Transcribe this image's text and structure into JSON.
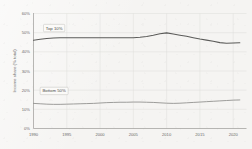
{
  "chart_data": {
    "type": "line",
    "title": "",
    "xlabel": "",
    "ylabel": "Income share (% total)",
    "xlim": [
      1990,
      2022
    ],
    "ylim": [
      0,
      60
    ],
    "grid": true,
    "legend_position": "inline-annotations",
    "x": [
      1990,
      1991,
      1992,
      1993,
      1994,
      1995,
      1996,
      1997,
      1998,
      1999,
      2000,
      2001,
      2002,
      2003,
      2004,
      2005,
      2006,
      2007,
      2008,
      2009,
      2010,
      2011,
      2012,
      2013,
      2014,
      2015,
      2016,
      2017,
      2018,
      2019,
      2020,
      2021
    ],
    "xticks": [
      "1990",
      "1995",
      "2000",
      "2005",
      "2010",
      "2015",
      "2020"
    ],
    "yticks": [
      "0%",
      "10%",
      "20%",
      "30%",
      "40%",
      "50%",
      "60%"
    ],
    "series": [
      {
        "name": "Top 10%",
        "label": "Top 10%",
        "color": "#5b5b59",
        "values": [
          46.0,
          46.6,
          47.0,
          47.2,
          47.3,
          47.3,
          47.4,
          47.4,
          47.4,
          47.4,
          47.4,
          47.4,
          47.4,
          47.3,
          47.3,
          47.4,
          47.6,
          48.0,
          48.6,
          49.4,
          49.9,
          49.3,
          48.7,
          48.1,
          47.4,
          46.7,
          46.1,
          45.5,
          44.8,
          44.5,
          44.6,
          44.7
        ]
      },
      {
        "name": "Bottom 50%",
        "label": "Bottom 50%",
        "color": "#8d8d8a",
        "values": [
          13.1,
          12.9,
          12.7,
          12.6,
          12.6,
          12.7,
          12.8,
          12.9,
          13.0,
          13.1,
          13.3,
          13.5,
          13.6,
          13.7,
          13.7,
          13.8,
          13.8,
          13.7,
          13.6,
          13.4,
          13.2,
          13.1,
          13.2,
          13.4,
          13.6,
          13.8,
          14.0,
          14.2,
          14.4,
          14.6,
          14.8,
          14.9
        ]
      }
    ],
    "annotations": [
      {
        "text": "Top 10%",
        "x": 1993.1,
        "y": 52.4
      },
      {
        "text": "Bottom 50%",
        "x": 1993.1,
        "y": 19.6
      }
    ]
  },
  "colors": {
    "background": "#f5f4f2",
    "grid": "#dcdbd7",
    "axis": "#9b9a96",
    "top_series": "#5b5b59",
    "bottom_series": "#8d8d8a",
    "tick_text": "#6a6a68"
  }
}
